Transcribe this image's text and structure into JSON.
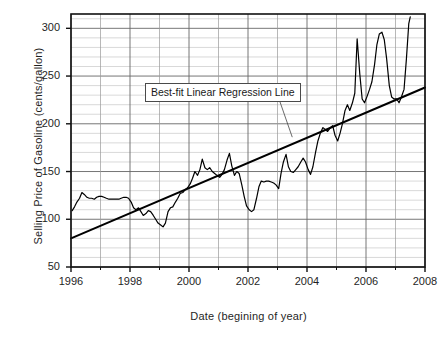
{
  "chart_data": {
    "type": "line",
    "title": "",
    "xlabel": "Date (begining of year)",
    "ylabel": "Selling Price of Gasoline (cents/gallon)",
    "xlim": [
      1996,
      2008
    ],
    "ylim": [
      50,
      315
    ],
    "y_ticks": [
      50,
      100,
      150,
      200,
      250,
      300
    ],
    "y_tick_labels": [
      "50",
      "100",
      "150",
      "200",
      "250",
      "300"
    ],
    "y_minor_step": 10,
    "x_ticks": [
      1996,
      1998,
      2000,
      2002,
      2004,
      2006,
      2008
    ],
    "x_tick_labels": [
      "1996",
      "1998",
      "2000",
      "2002",
      "2004",
      "2006",
      "2008"
    ],
    "x_minor_step": 1,
    "grid": true,
    "legend": "none",
    "annotations": [
      {
        "text": "Best-fit Linear Regression Line",
        "x": 2000.05,
        "y": 243,
        "leader_to_x": 2003.5,
        "leader_to_y": 186
      }
    ],
    "series": [
      {
        "name": "Selling Price of Gasoline",
        "color": "#000000",
        "x": [
          1996.04,
          1996.12,
          1996.2,
          1996.29,
          1996.37,
          1996.45,
          1996.54,
          1996.62,
          1996.7,
          1996.79,
          1996.87,
          1996.95,
          1997.04,
          1997.12,
          1997.2,
          1997.29,
          1997.37,
          1997.45,
          1997.54,
          1997.62,
          1997.7,
          1997.79,
          1997.87,
          1997.95,
          1998.04,
          1998.12,
          1998.2,
          1998.29,
          1998.37,
          1998.45,
          1998.54,
          1998.62,
          1998.7,
          1998.79,
          1998.87,
          1998.95,
          1999.04,
          1999.12,
          1999.2,
          1999.29,
          1999.37,
          1999.45,
          1999.54,
          1999.62,
          1999.7,
          1999.79,
          1999.87,
          1999.95,
          2000.04,
          2000.12,
          2000.2,
          2000.29,
          2000.37,
          2000.45,
          2000.54,
          2000.62,
          2000.7,
          2000.79,
          2000.87,
          2000.95,
          2001.04,
          2001.12,
          2001.2,
          2001.29,
          2001.37,
          2001.45,
          2001.54,
          2001.62,
          2001.7,
          2001.79,
          2001.87,
          2001.95,
          2002.04,
          2002.12,
          2002.2,
          2002.29,
          2002.37,
          2002.45,
          2002.54,
          2002.62,
          2002.7,
          2002.79,
          2002.87,
          2002.95,
          2003.04,
          2003.12,
          2003.2,
          2003.29,
          2003.37,
          2003.45,
          2003.54,
          2003.62,
          2003.7,
          2003.79,
          2003.87,
          2003.95,
          2004.04,
          2004.12,
          2004.2,
          2004.29,
          2004.37,
          2004.45,
          2004.54,
          2004.62,
          2004.7,
          2004.79,
          2004.87,
          2004.95,
          2005.04,
          2005.12,
          2005.2,
          2005.29,
          2005.37,
          2005.45,
          2005.54,
          2005.62,
          2005.7,
          2005.79,
          2005.87,
          2005.95,
          2006.04,
          2006.12,
          2006.2,
          2006.29,
          2006.37,
          2006.45,
          2006.54,
          2006.62,
          2006.7,
          2006.79,
          2006.87,
          2006.95,
          2007.04,
          2007.12,
          2007.2,
          2007.29,
          2007.37,
          2007.45,
          2007.5
        ],
        "y": [
          109,
          113,
          118,
          122,
          128,
          126,
          123,
          122,
          122,
          121,
          123,
          124,
          124,
          123,
          122,
          121,
          121,
          121,
          121,
          121,
          122,
          123,
          123,
          122,
          118,
          112,
          110,
          112,
          108,
          104,
          106,
          109,
          108,
          104,
          100,
          96,
          94,
          92,
          96,
          108,
          112,
          113,
          118,
          122,
          127,
          128,
          131,
          133,
          137,
          143,
          150,
          146,
          152,
          163,
          154,
          152,
          154,
          150,
          148,
          146,
          144,
          147,
          152,
          162,
          169,
          156,
          146,
          150,
          148,
          136,
          124,
          114,
          110,
          108,
          110,
          122,
          134,
          140,
          139,
          140,
          140,
          139,
          138,
          136,
          132,
          148,
          160,
          168,
          155,
          150,
          149,
          152,
          155,
          160,
          164,
          160,
          152,
          147,
          155,
          170,
          182,
          190,
          196,
          194,
          192,
          196,
          198,
          188,
          182,
          190,
          200,
          214,
          220,
          214,
          222,
          232,
          289,
          252,
          226,
          222,
          229,
          236,
          244,
          262,
          283,
          294,
          296,
          288,
          268,
          240,
          228,
          226,
          226,
          222,
          228,
          236,
          268,
          305,
          312
        ]
      },
      {
        "name": "Best-fit Linear Regression Line",
        "color": "#000000",
        "x": [
          1996.0,
          2008.0
        ],
        "y": [
          80,
          238
        ]
      }
    ]
  }
}
